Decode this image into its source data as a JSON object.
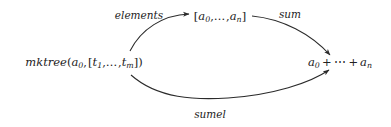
{
  "canvas": {
    "width": 391,
    "height": 127,
    "background": "#ffffff",
    "stroke_color": "#2b2b2b",
    "text_color": "#222222"
  },
  "diagram": {
    "kind": "commutative-diagram",
    "nodes": [
      {
        "id": "source",
        "name": "mktree-node",
        "text": "mktree(a0, [t1, …, tm])",
        "x": 84,
        "y": 63
      },
      {
        "id": "list",
        "name": "list-node",
        "text": "[a0, …, an]",
        "x": 220,
        "y": 17
      },
      {
        "id": "sum",
        "name": "sum-node",
        "text": "a0 + ⋯ + an",
        "x": 340,
        "y": 63
      }
    ],
    "edges": [
      {
        "id": "elements",
        "label": "elements",
        "from": "source",
        "to": "list",
        "arrowhead": true,
        "curve": "upper-left"
      },
      {
        "id": "sum",
        "label": "sum",
        "from": "list",
        "to": "sum",
        "arrowhead": true,
        "curve": "upper-right"
      },
      {
        "id": "sumel",
        "label": "sumel",
        "from": "source",
        "to": "sum",
        "arrowhead": true,
        "curve": "lower"
      }
    ]
  },
  "labels": {
    "elements": "elements",
    "sum": "sum",
    "sumel": "sumel"
  },
  "math": {
    "mktree_name": "mktree",
    "open_paren": "(",
    "close_paren": ")",
    "open_bracket": "[",
    "close_bracket": "]",
    "comma": ",",
    "ellipsis_low": "…",
    "ellipsis_center": "⋯",
    "plus": "+",
    "a": "a",
    "t": "t",
    "sub_0": "0",
    "sub_1": "1",
    "sub_n": "n",
    "sub_m": "m"
  }
}
